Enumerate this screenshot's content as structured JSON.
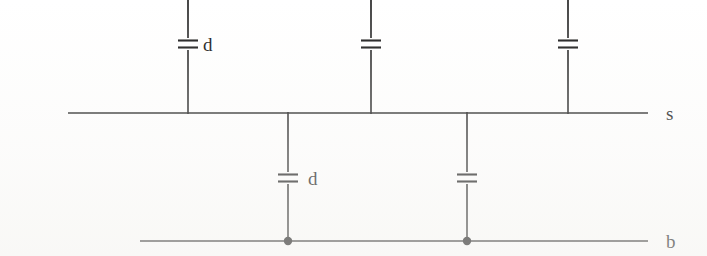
{
  "diagram": {
    "line_color": "#1a1a1a",
    "background_color": "#ffffff",
    "bus_lines": [
      {
        "id": "s-bus",
        "label": "s",
        "orientation": "horizontal",
        "x1": 68,
        "x2": 648,
        "y": 113,
        "label_x": 666,
        "label_y": 120
      },
      {
        "id": "b-bus",
        "label": "b",
        "orientation": "horizontal",
        "x1": 140,
        "x2": 648,
        "y": 241,
        "label_x": 666,
        "label_y": 248
      }
    ],
    "upper_branches": [
      {
        "id": "upper-branch-1",
        "x": 188,
        "y_top": 0,
        "y_bottom": 113,
        "capacitor_y": 44,
        "label": "d",
        "label_x": 203,
        "label_y": 51
      },
      {
        "id": "upper-branch-2",
        "x": 371,
        "y_top": 0,
        "y_bottom": 113,
        "capacitor_y": 44,
        "label": "",
        "label_x": 386,
        "label_y": 51
      },
      {
        "id": "upper-branch-3",
        "x": 568,
        "y_top": 0,
        "y_bottom": 113,
        "capacitor_y": 44,
        "label": "",
        "label_x": 583,
        "label_y": 51
      }
    ],
    "lower_branches": [
      {
        "id": "lower-branch-1",
        "x": 288,
        "y_top": 113,
        "y_bottom": 241,
        "capacitor_y": 178,
        "label": "d",
        "label_x": 308,
        "label_y": 185,
        "junction": true
      },
      {
        "id": "lower-branch-2",
        "x": 467,
        "y_top": 113,
        "y_bottom": 241,
        "capacitor_y": 178,
        "label": "",
        "label_x": 487,
        "label_y": 185,
        "junction": true
      }
    ],
    "capacitor_symbol": {
      "plate_half_width": 10,
      "plate_gap": 7,
      "name": "capacitor-symbol"
    },
    "junction_dot_radius": 4.2
  }
}
